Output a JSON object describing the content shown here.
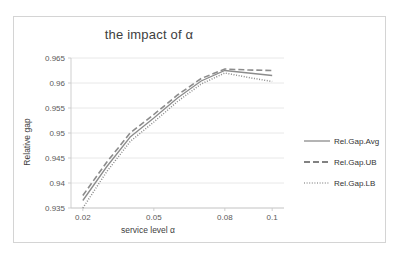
{
  "chart_data": {
    "type": "line",
    "title": "the impact of α",
    "xlabel": "service level α",
    "ylabel": "Relative gap",
    "x": [
      0.02,
      0.03,
      0.04,
      0.05,
      0.06,
      0.07,
      0.08,
      0.09,
      0.1
    ],
    "xtick_labels": [
      "0.02",
      "0.05",
      "0.08",
      "0.1"
    ],
    "xtick_values": [
      0.02,
      0.05,
      0.08,
      0.1
    ],
    "ytick_labels": [
      "0.965",
      "0.96",
      "0.955",
      "0.95",
      "0.945",
      "0.94",
      "0.935"
    ],
    "ytick_values": [
      0.965,
      0.96,
      0.955,
      0.95,
      0.945,
      0.94,
      0.935
    ],
    "ylim": [
      0.935,
      0.965
    ],
    "xlim": [
      0.015,
      0.105
    ],
    "grid": "horizontal",
    "legend_position": "right",
    "series": [
      {
        "name": "Rel.Gap.Avg",
        "style": "solid",
        "color": "#8c8c8c",
        "values": [
          0.9365,
          0.9432,
          0.9492,
          0.953,
          0.957,
          0.9604,
          0.9625,
          0.962,
          0.9615
        ]
      },
      {
        "name": "Rel.Gap.UB",
        "style": "dashed",
        "color": "#5a5a5a",
        "values": [
          0.9375,
          0.9441,
          0.95,
          0.9537,
          0.9576,
          0.9609,
          0.9628,
          0.9626,
          0.9625
        ]
      },
      {
        "name": "Rel.Gap.LB",
        "style": "dotted",
        "color": "#9e9e9e",
        "values": [
          0.935,
          0.9422,
          0.9483,
          0.9522,
          0.9563,
          0.9598,
          0.962,
          0.9611,
          0.9603
        ]
      }
    ]
  }
}
